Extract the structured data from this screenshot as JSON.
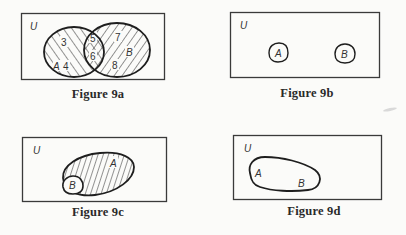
{
  "figures": [
    {
      "id": "9a",
      "caption": "Figure 9a",
      "universe_label": "U",
      "sets": [
        "A",
        "B"
      ],
      "relationship": "overlapping",
      "region_numbers": {
        "A_only": [
          "3",
          "4"
        ],
        "A_and_B": [
          "5",
          "6"
        ],
        "B_only": [
          "7",
          "8"
        ]
      },
      "shading": {
        "A": "diagonal hatching (\\)",
        "B": "diagonal hatching (/)",
        "A_and_B": "cross-hatched"
      }
    },
    {
      "id": "9b",
      "caption": "Figure 9b",
      "universe_label": "U",
      "sets": [
        "A",
        "B"
      ],
      "relationship": "disjoint"
    },
    {
      "id": "9c",
      "caption": "Figure 9c",
      "universe_label": "U",
      "sets": [
        "A",
        "B"
      ],
      "relationship": "B subset of A",
      "shading": {
        "A": "vertical hatching"
      }
    },
    {
      "id": "9d",
      "caption": "Figure 9d",
      "universe_label": "U",
      "sets": [
        "A",
        "B"
      ],
      "relationship": "A equals B (single shared region)"
    }
  ],
  "labels": {
    "u": "U",
    "a": "A",
    "b": "B",
    "n3": "3",
    "n4": "4",
    "n5": "5",
    "n6": "6",
    "n7": "7",
    "n8": "8"
  },
  "colors": {
    "ink": "#1e1e1e",
    "paper": "#fbfbf9",
    "box": "#3a3a3a"
  }
}
